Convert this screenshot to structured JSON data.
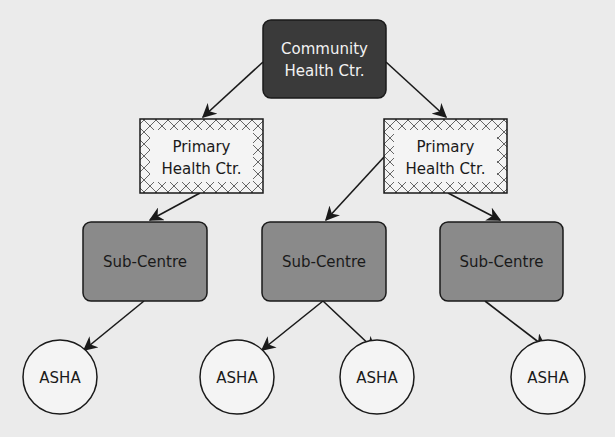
{
  "diagram": {
    "type": "hierarchy",
    "background": "#ebebeb",
    "colors": {
      "community_fill": "#3a3a3a",
      "community_text": "#f2f2f2",
      "phc_fill": "#f4f4f4",
      "phc_pattern": "#555555",
      "subcentre_fill": "#8a8a8a",
      "asha_fill": "#f4f4f4",
      "stroke": "#1a1a1a"
    },
    "nodes": {
      "community": {
        "line1": "Community",
        "line2": "Health Ctr."
      },
      "phc_left": {
        "line1": "Primary",
        "line2": "Health Ctr."
      },
      "phc_right": {
        "line1": "Primary",
        "line2": "Health Ctr."
      },
      "sub_1": {
        "label": "Sub-Centre"
      },
      "sub_2": {
        "label": "Sub-Centre"
      },
      "sub_3": {
        "label": "Sub-Centre"
      },
      "asha_1": {
        "label": "ASHA"
      },
      "asha_2": {
        "label": "ASHA"
      },
      "asha_3": {
        "label": "ASHA"
      },
      "asha_4": {
        "label": "ASHA"
      }
    },
    "edges": [
      [
        "community",
        "phc_left"
      ],
      [
        "community",
        "phc_right"
      ],
      [
        "phc_left",
        "sub_1"
      ],
      [
        "phc_right",
        "sub_2"
      ],
      [
        "phc_right",
        "sub_3"
      ],
      [
        "sub_1",
        "asha_1"
      ],
      [
        "sub_2",
        "asha_2"
      ],
      [
        "sub_2",
        "asha_3"
      ],
      [
        "sub_3",
        "asha_4"
      ]
    ]
  }
}
